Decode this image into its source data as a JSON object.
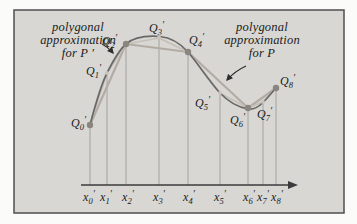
{
  "figure": {
    "panel_bg": "#d8d7d3",
    "border_color": "#4f4f4f",
    "curve_color": "#696969",
    "coarse_polygon_color": "#b3aca4",
    "refined_polygon_color": "#c6bfb7",
    "major_dot_color": "#8a857f",
    "minor_dot_color": "#c9c2ba",
    "axis_color": "#3b3b3b",
    "text_color": "#1b1b1b",
    "left_caption": {
      "line1": "polygonal",
      "line2": "approximation",
      "line3": "for P ′"
    },
    "right_caption": {
      "line1": "polygonal",
      "line2": "approximation",
      "line3": "for P"
    },
    "points": [
      {
        "q": {
          "base": "Q",
          "sub": "0",
          "prime": "′"
        },
        "x_label": {
          "base": "x",
          "sub": "0",
          "prime": "′"
        }
      },
      {
        "q": {
          "base": "Q",
          "sub": "1",
          "prime": "′"
        },
        "x_label": {
          "base": "x",
          "sub": "1",
          "prime": "′"
        }
      },
      {
        "q": {
          "base": "Q",
          "sub": "2",
          "prime": "′"
        },
        "x_label": {
          "base": "x",
          "sub": "2",
          "prime": "′"
        }
      },
      {
        "q": {
          "base": "Q",
          "sub": "3",
          "prime": "′"
        },
        "x_label": {
          "base": "x",
          "sub": "3",
          "prime": "′"
        }
      },
      {
        "q": {
          "base": "Q",
          "sub": "4",
          "prime": "′"
        },
        "x_label": {
          "base": "x",
          "sub": "4",
          "prime": "′"
        }
      },
      {
        "q": {
          "base": "Q",
          "sub": "5",
          "prime": "′"
        },
        "x_label": {
          "base": "x",
          "sub": "5",
          "prime": "′"
        }
      },
      {
        "q": {
          "base": "Q",
          "sub": "6",
          "prime": "′"
        },
        "x_label": {
          "base": "x",
          "sub": "6",
          "prime": "′"
        }
      },
      {
        "q": {
          "base": "Q",
          "sub": "7",
          "prime": "′"
        },
        "x_label": {
          "base": "x",
          "sub": "7",
          "prime": "′"
        }
      },
      {
        "q": {
          "base": "Q",
          "sub": "8",
          "prime": "′"
        },
        "x_label": {
          "base": "x",
          "sub": "8",
          "prime": "′"
        }
      }
    ]
  }
}
